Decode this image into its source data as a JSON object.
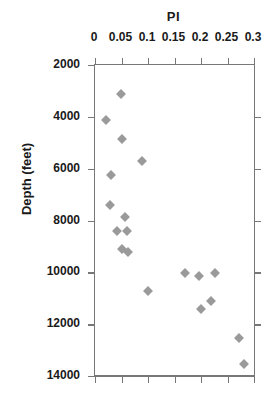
{
  "chart_data": {
    "type": "scatter",
    "title": "PI",
    "xlabel": "PI",
    "ylabel": "Depth  (feet)",
    "xlim": [
      0,
      0.3
    ],
    "ylim": [
      2000,
      14000
    ],
    "y_inverted": true,
    "grid": false,
    "legend": null,
    "marker": {
      "shape": "diamond",
      "color": "#9a9a9a",
      "size": 7
    },
    "xticks": [
      0,
      0.05,
      0.1,
      0.15,
      0.2,
      0.25,
      0.3
    ],
    "xtick_labels": [
      "0",
      "0.05",
      "0.1",
      "0.15",
      "0.2",
      "0.25",
      "0.3"
    ],
    "yticks": [
      2000,
      4000,
      6000,
      8000,
      10000,
      12000,
      14000
    ],
    "ytick_labels": [
      "2000",
      "4000",
      "6000",
      "8000",
      "10000",
      "12000",
      "14000"
    ],
    "points": [
      {
        "x": 0.049,
        "y": 3100
      },
      {
        "x": 0.021,
        "y": 4120
      },
      {
        "x": 0.051,
        "y": 4860
      },
      {
        "x": 0.089,
        "y": 5690
      },
      {
        "x": 0.03,
        "y": 6230
      },
      {
        "x": 0.028,
        "y": 7390
      },
      {
        "x": 0.057,
        "y": 7850
      },
      {
        "x": 0.041,
        "y": 8390
      },
      {
        "x": 0.06,
        "y": 8390
      },
      {
        "x": 0.051,
        "y": 9090
      },
      {
        "x": 0.062,
        "y": 9200
      },
      {
        "x": 0.17,
        "y": 10010
      },
      {
        "x": 0.196,
        "y": 10130
      },
      {
        "x": 0.226,
        "y": 10010
      },
      {
        "x": 0.1,
        "y": 10710
      },
      {
        "x": 0.2,
        "y": 11420
      },
      {
        "x": 0.219,
        "y": 11110
      },
      {
        "x": 0.272,
        "y": 12540
      },
      {
        "x": 0.281,
        "y": 13550
      }
    ]
  }
}
